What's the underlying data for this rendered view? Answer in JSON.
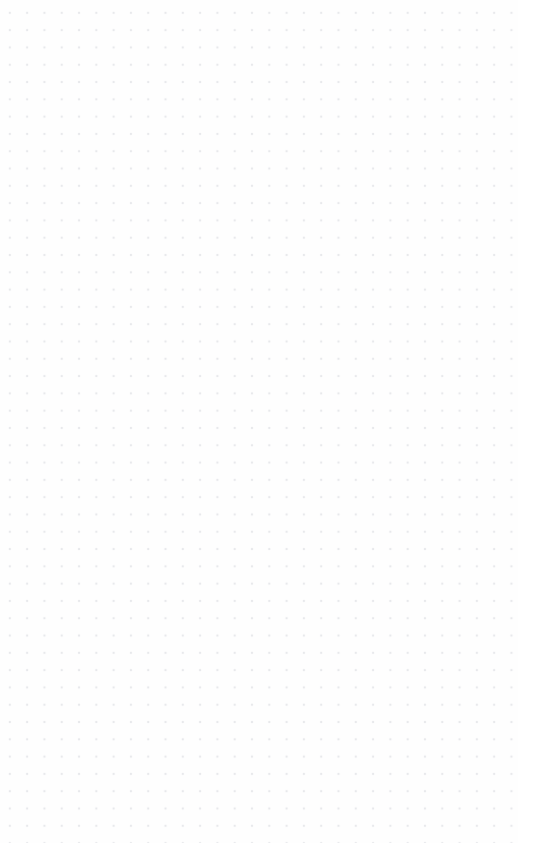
{
  "canvas": {
    "name": "canvas",
    "state": "empty",
    "background_color": "#fefefe",
    "page_background_color": "#ffffff",
    "width": 533,
    "height": 863,
    "grid": {
      "name": "dot-grid",
      "visible": true,
      "style": "dots",
      "dot_color": "#e8e9ec",
      "dot_diameter_px": 1.5,
      "spacing_x_px": 17.3,
      "spacing_y_px": 17.3,
      "origin_x_px": 2,
      "origin_y_px": 5,
      "columns": 31,
      "rows": 49,
      "grid_extent_width_px": 518,
      "grid_extent_height_px": 843
    },
    "margins": {
      "right_px": 15,
      "bottom_px": 20,
      "color": "#ffffff"
    },
    "content": {
      "shapes": [],
      "text_elements": [],
      "annotations": [],
      "selection": null
    },
    "empty_state_text": ""
  }
}
